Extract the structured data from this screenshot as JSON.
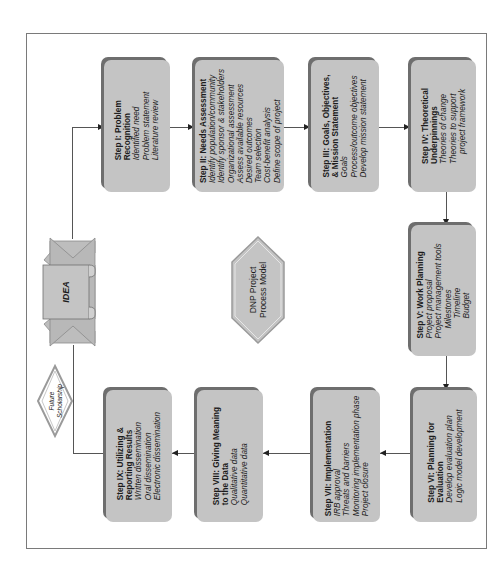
{
  "diagram": {
    "title": "DNP Project Process Model",
    "title_lines": [
      "DNP Project",
      "Process Model"
    ],
    "start_node": {
      "label": "IDEA"
    },
    "feedback_node": {
      "label_lines": [
        "Future",
        "Scholarship"
      ]
    },
    "colors": {
      "box_fill": "#c4c4c4",
      "box_shadow": "#6e6e6e",
      "line": "#555555",
      "frame": "#7a7a7a",
      "text": "#1c1c1c"
    },
    "steps": [
      {
        "id": "I",
        "title_lines": [
          "Step I: Problem",
          "Recognition"
        ],
        "items": [
          "Identified need",
          "Problem statement",
          "Literature review"
        ]
      },
      {
        "id": "II",
        "title_lines": [
          "Step II: Needs Assessment"
        ],
        "items": [
          "Identify population/community",
          "Identify sponsor & stakeholders",
          "Organizational assessment",
          "Assess available resources",
          "Desired outcomes",
          "Team selection",
          "Cost-benefit analysis",
          "Define scope of project"
        ]
      },
      {
        "id": "III",
        "title_lines": [
          "Step III: Goals, Objectives,",
          "& Mission Statement"
        ],
        "items": [
          "Goals",
          "Process/outcome objectives",
          "Develop mission statement"
        ]
      },
      {
        "id": "IV",
        "title_lines": [
          "Step IV: Theoretical",
          "Underpinnings"
        ],
        "items": [
          "Theories of change",
          "Theories to support",
          "project framework"
        ]
      },
      {
        "id": "V",
        "title_lines": [
          "Step V: Work Planning"
        ],
        "items": [
          "Project proposal",
          "Project management tools",
          "Milestones",
          "Timeline",
          "Budget"
        ]
      },
      {
        "id": "VI",
        "title_lines": [
          "Step VI: Planning for",
          "Evaluation"
        ],
        "items": [
          "Develop evaluation plan",
          "Logic model development"
        ]
      },
      {
        "id": "VII",
        "title_lines": [
          "Step VII: Implementation"
        ],
        "items": [
          "IRB approval",
          "Threats and barriers",
          "Monitoring implementation phase",
          "Project closure"
        ]
      },
      {
        "id": "VIII",
        "title_lines": [
          "Step VIII: Giving Meaning",
          "to the Data"
        ],
        "items": [
          "Qualitative data",
          "Quantitative data"
        ]
      },
      {
        "id": "IX",
        "title_lines": [
          "Step IX: Utilizing &",
          "Reporting Results"
        ],
        "items": [
          "Written dissemination",
          "Oral dissemination",
          "Electronic dissemination"
        ]
      }
    ],
    "flow": [
      "IDEA",
      "I",
      "II",
      "III",
      "IV",
      "V",
      "VI",
      "VII",
      "VIII",
      "IX",
      "IDEA"
    ]
  }
}
